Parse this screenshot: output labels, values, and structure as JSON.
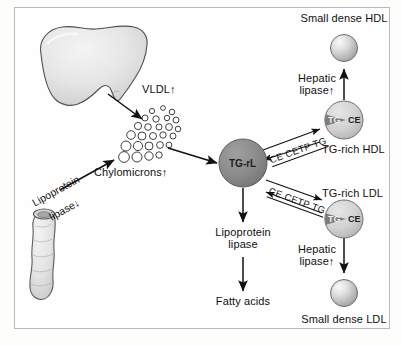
{
  "figure": {
    "border_color": "#b9b9b9",
    "background": "#fefefe"
  },
  "organs": [
    {
      "id": "liver",
      "name": "liver",
      "fill": "#e8e8e8",
      "stroke": "#4a4a4a"
    },
    {
      "id": "intestine",
      "name": "intestine",
      "fill": "#ebebeb",
      "stroke": "#5a5a5a"
    }
  ],
  "labels": {
    "vldl": "VLDL↑",
    "chylomicrons": "Chylomicrons↑",
    "lipoprotein_lipase_down_line1": "Lipoprotein",
    "lipoprotein_lipase_down_line2": "lipase↓",
    "tg_rl": "TG-rL",
    "lipoprotein_lipase_line1": "Lipoprotein",
    "lipoprotein_lipase_line2": "lipase",
    "fatty_acids": "Fatty acids",
    "small_dense_hdl": "Small dense HDL",
    "tg_rich_hdl": "TG-rich HDL",
    "small_dense_ldl": "Small dense LDL",
    "tg_rich_ldl": "TG-rich LDL",
    "hepatic_lipase_hdl_line1": "Hepatic",
    "hepatic_lipase_hdl_line2": "lipase↑",
    "hepatic_lipase_ldl_line1": "Hepatic",
    "hepatic_lipase_ldl_line2": "lipase↑",
    "cetp_upper": "CE CETP TG",
    "cetp_lower": "CE CETP TG",
    "particle_tg": "TG",
    "particle_ce": "CE"
  },
  "particles": {
    "tg_rl_circle": {
      "fill": "#8d8d8d",
      "stroke": "#5c5c5c",
      "text_color": "#1d1d1d"
    },
    "tg_rich": {
      "fill": "#d6d6d6",
      "stroke": "#6f6f6f",
      "wedge_fill": "#7c7c7c"
    },
    "small_dense": {
      "fill": "#d0d0d0",
      "stroke": "#6b6b6b",
      "highlight": "#f2f2f2"
    }
  },
  "colors": {
    "arrow": "#111111",
    "text": "#111111"
  },
  "vldl_cluster": {
    "name": "vldl-chylomicron-particle-cluster",
    "particle_outline": "#2b2b2b",
    "particle_fill": "#ffffff",
    "count": 26
  }
}
